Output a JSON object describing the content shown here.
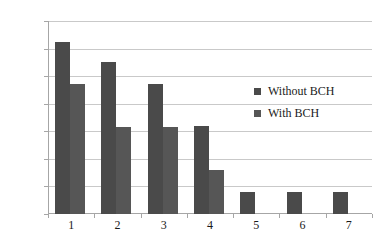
{
  "chart_data": {
    "type": "bar",
    "title": "",
    "subtitle": "",
    "xlabel": "",
    "ylabel": "",
    "categories": [
      "1",
      "2",
      "3",
      "4",
      "5",
      "6",
      "7"
    ],
    "series": [
      {
        "name": "Without BCH",
        "color": "#4a4a4a",
        "values": [
          0.0625,
          0.055,
          0.047,
          0.032,
          0.008,
          0.008,
          0.008
        ]
      },
      {
        "name": "With BCH",
        "color": "#565656",
        "values": [
          0.047,
          0.0315,
          0.0315,
          0.016,
          null,
          null,
          null
        ]
      }
    ],
    "ylim": [
      0,
      0.07
    ],
    "ytick_labels": [
      "0.07",
      "0.06",
      "0.05",
      "0.04",
      "0.03",
      "0.02",
      "0.01",
      "0"
    ],
    "ytick_values": [
      0.07,
      0.06,
      0.05,
      0.04,
      0.03,
      0.02,
      0.01,
      0
    ],
    "grid": true,
    "grid_axis": "y",
    "legend_position": "inside-right",
    "annotations": []
  },
  "legend": {
    "entries": [
      {
        "label": "Without BCH",
        "marker": "square-marker"
      },
      {
        "label": "With BCH",
        "marker": "square-marker"
      }
    ]
  },
  "colors": {
    "series_without_bch": "#4a4a4a",
    "series_with_bch": "#565656",
    "gridline": "#c9c9c9",
    "axis": "#a6a6a6",
    "text": "#1a1a1a",
    "background": "#ffffff"
  }
}
